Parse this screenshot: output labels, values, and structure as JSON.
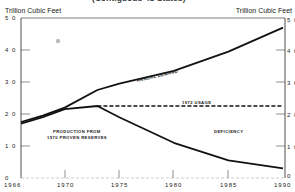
{
  "header": {
    "subtitle": "(Contiguous 48 States)",
    "unit_left": "Trillion Cubic Feet",
    "unit_right": "Trillion Cubic Feet"
  },
  "axes": {
    "y_ticks": [
      "5 0",
      "4 0",
      "3 0",
      "2 0",
      "1 0",
      "0"
    ],
    "x_ticks": [
      "1966",
      "1970",
      "1975",
      "1980",
      "1985",
      "1990"
    ]
  },
  "annotations": {
    "annual_demand": "ANNUAL DEMAND",
    "usage_1972": "1972 USAGE",
    "production_line1": "PRODUCTION FROM",
    "production_line2": "1970 PROVEN RESERVES",
    "deficiency": "DEFICIENCY"
  },
  "chart_data": {
    "type": "line",
    "title": "(Contiguous 48 States)",
    "xlabel": "",
    "ylabel": "Trillion Cubic Feet",
    "ylabel_right": "Trillion Cubic Feet",
    "xlim": [
      1966,
      1990
    ],
    "ylim": [
      0,
      50
    ],
    "x_ticks": [
      1966,
      1970,
      1975,
      1980,
      1985,
      1990
    ],
    "y_ticks": [
      0,
      10,
      20,
      30,
      40,
      50
    ],
    "grid": false,
    "series": [
      {
        "name": "Annual Demand",
        "style": "solid",
        "x": [
          1966,
          1968,
          1970,
          1973,
          1975,
          1980,
          1985,
          1990
        ],
        "values": [
          17.5,
          19.5,
          22.0,
          27.5,
          29.5,
          33.5,
          39.5,
          47.0
        ]
      },
      {
        "name": "Production from 1970 Proven Reserves",
        "style": "solid",
        "x": [
          1966,
          1968,
          1970,
          1973,
          1975,
          1980,
          1985,
          1990
        ],
        "values": [
          17.0,
          19.0,
          21.5,
          22.5,
          19.0,
          11.0,
          5.5,
          3.0
        ]
      },
      {
        "name": "1972 Usage",
        "style": "dashed",
        "x": [
          1973,
          1990
        ],
        "values": [
          22.5,
          22.5
        ]
      }
    ],
    "annotations": [
      "ANNUAL DEMAND",
      "1972 USAGE",
      "PRODUCTION FROM 1970 PROVEN RESERVES",
      "DEFICIENCY"
    ]
  }
}
